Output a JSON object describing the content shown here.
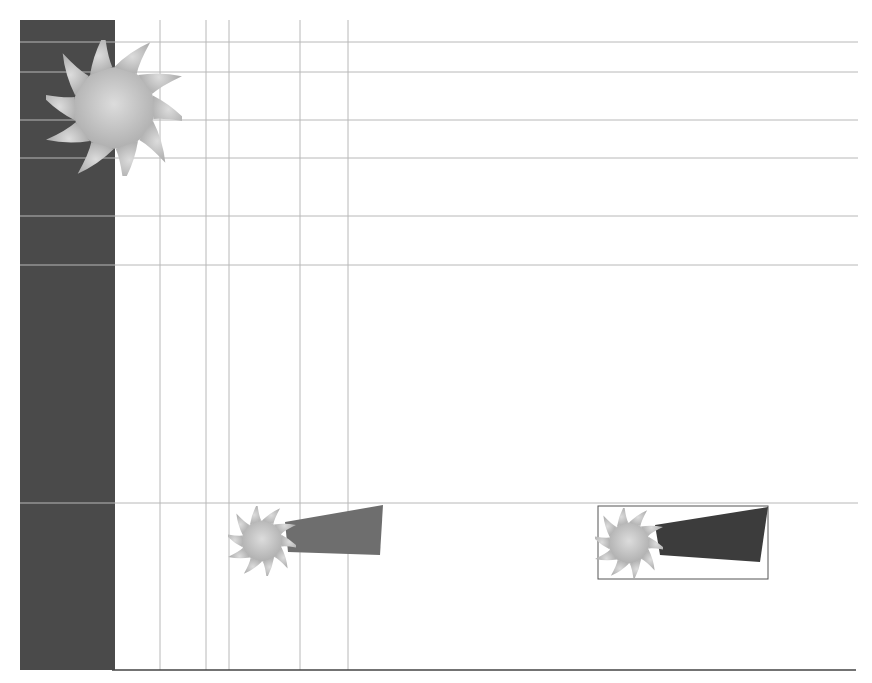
{
  "diagram": {
    "type": "layout-grid",
    "colors": {
      "background": "#ffffff",
      "panel": "#4a4a4a",
      "grid": "#b8b8b8",
      "logo_light": "#d6d6d6",
      "logo_mid": "#b4b4b4",
      "wedge_mid": "#6e6e6e",
      "wedge_dark": "#3c3c3c",
      "baseline": "#444444"
    },
    "dark_panel": {
      "x": 20,
      "y": 20,
      "width": 95,
      "height": 650
    },
    "vertical_guides": [
      160,
      206,
      229,
      300,
      348
    ],
    "horizontal_guides": [
      42,
      72,
      120,
      158,
      216,
      265,
      503
    ],
    "baseline_y": 670,
    "elements": [
      {
        "name": "large-logo",
        "shape": "saw-sun",
        "cx": 113,
        "cy": 110,
        "r": 65
      },
      {
        "name": "small-logo-1",
        "shape": "saw-sun",
        "cx": 262,
        "cy": 540,
        "r": 34
      },
      {
        "name": "wedge-1",
        "shape": "wedge",
        "points": "285,520 383,505 380,555 288,552",
        "fill_key": "wedge_mid"
      },
      {
        "name": "small-logo-2",
        "shape": "saw-sun",
        "cx": 628,
        "cy": 542,
        "r": 34
      },
      {
        "name": "wedge-2",
        "shape": "wedge",
        "points": "655,525 768,507 760,562 660,555",
        "fill_key": "wedge_dark"
      },
      {
        "name": "frame-2",
        "shape": "rect",
        "x": 598,
        "y": 506,
        "width": 170,
        "height": 73
      }
    ]
  }
}
